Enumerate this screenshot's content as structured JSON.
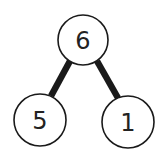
{
  "diagram": {
    "type": "number-bond",
    "whole": {
      "label": "6"
    },
    "parts": [
      {
        "label": "5"
      },
      {
        "label": "1"
      }
    ],
    "colors": {
      "stroke": "#1a1a1a",
      "fill": "#ffffff",
      "text": "#222222"
    }
  }
}
